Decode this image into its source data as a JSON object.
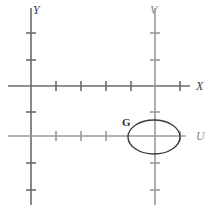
{
  "figure": {
    "title_text": "",
    "background_color": "#ffffff",
    "width": 211,
    "height": 209
  },
  "colors": {
    "primary_axis": "#6b6b6b",
    "secondary_axis": "#9a9a9a",
    "curve": "#3a3a3a",
    "label": "#3a3a3a"
  },
  "axes": [
    {
      "name": "y-axis",
      "label": "Y",
      "orientation": "vertical",
      "position": 31,
      "start": 8,
      "end": 205,
      "color_role": "primary_axis",
      "label_x": 33,
      "label_y": 12,
      "ticks": [
        33,
        60,
        112,
        163,
        190
      ],
      "tick_half_length": 5
    },
    {
      "name": "x-axis",
      "label": "X",
      "orientation": "horizontal",
      "position": 86,
      "start": 8,
      "end": 190,
      "color_role": "primary_axis",
      "label_x": 196,
      "label_y": 90,
      "ticks": [
        56,
        81,
        106,
        131,
        180
      ],
      "tick_half_length": 5
    },
    {
      "name": "v-axis",
      "label": "V",
      "orientation": "vertical",
      "position": 155,
      "start": 8,
      "end": 205,
      "color_role": "secondary_axis",
      "label_x": 152,
      "label_y": 12,
      "ticks": [
        33,
        60,
        112,
        163,
        190
      ],
      "tick_half_length": 5
    },
    {
      "name": "u-axis",
      "label": "U",
      "orientation": "horizontal",
      "position": 136,
      "start": 8,
      "end": 186,
      "color_role": "secondary_axis",
      "label_x": 196,
      "label_y": 140,
      "ticks": [
        56,
        81,
        106,
        180
      ],
      "tick_half_length": 5
    }
  ],
  "shapes": [
    {
      "name": "ellipse-g",
      "type": "ellipse",
      "label": "G",
      "cx": 154,
      "cy": 137,
      "rx": 26,
      "ry": 17,
      "label_x": 124,
      "label_y": 125
    }
  ]
}
